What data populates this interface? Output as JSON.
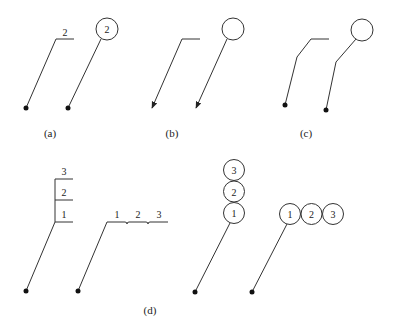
{
  "figure": {
    "captions": {
      "a": "(a)",
      "b": "(b)",
      "c": "(c)",
      "d": "(d)"
    },
    "a": {
      "flag_label": "2",
      "balloon_label": "2"
    },
    "d": {
      "vertical_stack_labels": [
        "3",
        "2",
        "1"
      ],
      "horizontal_row_labels": [
        "1",
        "2",
        "3"
      ],
      "balloon_stack_labels": [
        "3",
        "2",
        "1"
      ],
      "balloon_row_labels": [
        "1",
        "2",
        "3"
      ]
    },
    "colors": {
      "line": "#333333",
      "dot": "#111111",
      "background": "#ffffff"
    }
  }
}
